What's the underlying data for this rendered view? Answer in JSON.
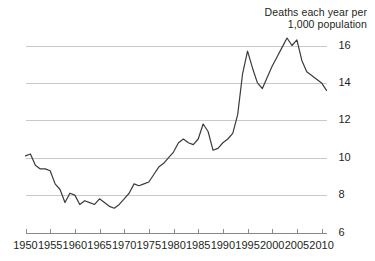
{
  "chart_data": {
    "type": "line",
    "title_line1": "Deaths each year per",
    "title_line2": "1,000 population",
    "xlabel": "",
    "ylabel": "",
    "xlim": [
      1950,
      2011
    ],
    "ylim": [
      6,
      16.8
    ],
    "grid": true,
    "grid_axis": "y",
    "legend": "none",
    "y_ticks": [
      6,
      8,
      10,
      12,
      14,
      16
    ],
    "y_tick_labels": [
      "6",
      "8",
      "10",
      "12",
      "14",
      "16"
    ],
    "y_tick_side": "right",
    "x_ticks": [
      1950,
      1955,
      1960,
      1965,
      1970,
      1975,
      1980,
      1985,
      1990,
      1995,
      2000,
      2005,
      2010
    ],
    "x_tick_labels": [
      "1950",
      "1955",
      "1960",
      "1965",
      "1970",
      "1975",
      "1980",
      "1985",
      "1990",
      "1995",
      "2000",
      "2005",
      "2010"
    ],
    "line_color": "#3b3b3b",
    "grid_color": "#c9c9c9",
    "axis_color": "#8a8a8a",
    "background_color": "#ffffff",
    "x": [
      1950,
      1951,
      1952,
      1953,
      1954,
      1955,
      1956,
      1957,
      1958,
      1959,
      1960,
      1961,
      1962,
      1963,
      1964,
      1965,
      1966,
      1967,
      1968,
      1969,
      1970,
      1971,
      1972,
      1973,
      1974,
      1975,
      1976,
      1977,
      1978,
      1979,
      1980,
      1981,
      1982,
      1983,
      1984,
      1985,
      1986,
      1987,
      1988,
      1989,
      1990,
      1991,
      1992,
      1993,
      1994,
      1995,
      1996,
      1997,
      1998,
      1999,
      2000,
      2001,
      2002,
      2003,
      2004,
      2005,
      2006,
      2007,
      2008,
      2009,
      2010,
      2011
    ],
    "values": [
      10.1,
      10.2,
      9.6,
      9.4,
      9.4,
      9.3,
      8.6,
      8.3,
      7.6,
      8.1,
      8.0,
      7.5,
      7.7,
      7.6,
      7.5,
      7.8,
      7.6,
      7.4,
      7.3,
      7.5,
      7.8,
      8.1,
      8.6,
      8.5,
      8.6,
      8.7,
      9.1,
      9.5,
      9.7,
      10.0,
      10.3,
      10.8,
      11.0,
      10.8,
      10.7,
      11.0,
      11.8,
      11.4,
      10.4,
      10.5,
      10.8,
      11.0,
      11.3,
      12.3,
      14.5,
      15.7,
      14.8,
      14.0,
      13.7,
      14.3,
      14.9,
      15.4,
      15.9,
      16.4,
      16.0,
      16.3,
      15.2,
      14.6,
      14.4,
      14.2,
      14.0,
      13.6
    ],
    "series_name": "Death rate"
  }
}
